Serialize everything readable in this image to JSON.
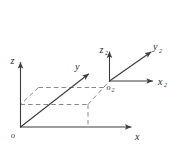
{
  "figure": {
    "background_color": "#ffffff",
    "line_color": "#4a4a4a",
    "dashed_color": "#6e6e6e",
    "label_color": "#2b2b2b",
    "width": 179,
    "height": 155
  },
  "frame1": {
    "name": "primary-frame",
    "origin_label": "o",
    "axes": [
      {
        "id": "z",
        "label": "z",
        "subscript": "",
        "direction": "up"
      },
      {
        "id": "y",
        "label": "y",
        "subscript": "",
        "direction": "up-right-oblique"
      },
      {
        "id": "x",
        "label": "x",
        "subscript": "",
        "direction": "right"
      }
    ]
  },
  "frame2": {
    "name": "secondary-frame",
    "origin_label": "o",
    "origin_subscript": "2",
    "axes": [
      {
        "id": "z2",
        "label": "z",
        "subscript": "2",
        "direction": "up"
      },
      {
        "id": "y2",
        "label": "y",
        "subscript": "2",
        "direction": "up-right-oblique"
      },
      {
        "id": "x2",
        "label": "x",
        "subscript": "2",
        "direction": "right"
      }
    ]
  },
  "construction": {
    "dashed_parallelogram": "projection plane outline",
    "dashed_dropline": "vertical projection to x-axis",
    "dashed_connector": "oblique line to second origin"
  }
}
